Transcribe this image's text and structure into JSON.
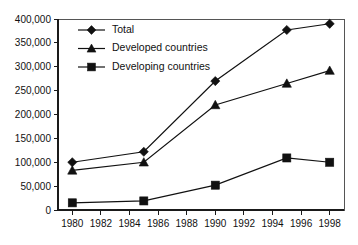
{
  "chart_data": {
    "type": "line",
    "title": "",
    "subtitle": "",
    "xlabel": "",
    "ylabel": "",
    "x": [
      1980,
      1985,
      1990,
      1995,
      1998
    ],
    "xlim": [
      1979,
      1999
    ],
    "ylim": [
      0,
      400000
    ],
    "grid": false,
    "legend_position": "top-left",
    "x_ticks": [
      1980,
      1982,
      1984,
      1986,
      1988,
      1990,
      1992,
      1994,
      1996,
      1998
    ],
    "x_tick_labels": [
      "1980",
      "1982",
      "1984",
      "1986",
      "1988",
      "1990",
      "1992",
      "1994",
      "1996",
      "1998"
    ],
    "y_ticks": [
      0,
      50000,
      100000,
      150000,
      200000,
      250000,
      300000,
      350000,
      400000
    ],
    "y_tick_labels": [
      "0",
      "50,000",
      "100,000",
      "150,000",
      "200,000",
      "250,000",
      "300,000",
      "350,000",
      "400,000"
    ],
    "series": [
      {
        "name": "Total",
        "marker": "diamond",
        "color": "#111111",
        "values": [
          100000,
          122000,
          270000,
          377000,
          390000
        ]
      },
      {
        "name": "Developed countries",
        "marker": "triangle",
        "color": "#111111",
        "values": [
          83000,
          100000,
          220000,
          265000,
          292000
        ]
      },
      {
        "name": "Developing countries",
        "marker": "square",
        "color": "#111111",
        "values": [
          15000,
          19000,
          52000,
          109000,
          100000
        ]
      }
    ]
  },
  "legend": {
    "items": [
      {
        "label": "Total",
        "marker": "diamond"
      },
      {
        "label": "Developed countries",
        "marker": "triangle"
      },
      {
        "label": "Developing countries",
        "marker": "square"
      }
    ]
  }
}
